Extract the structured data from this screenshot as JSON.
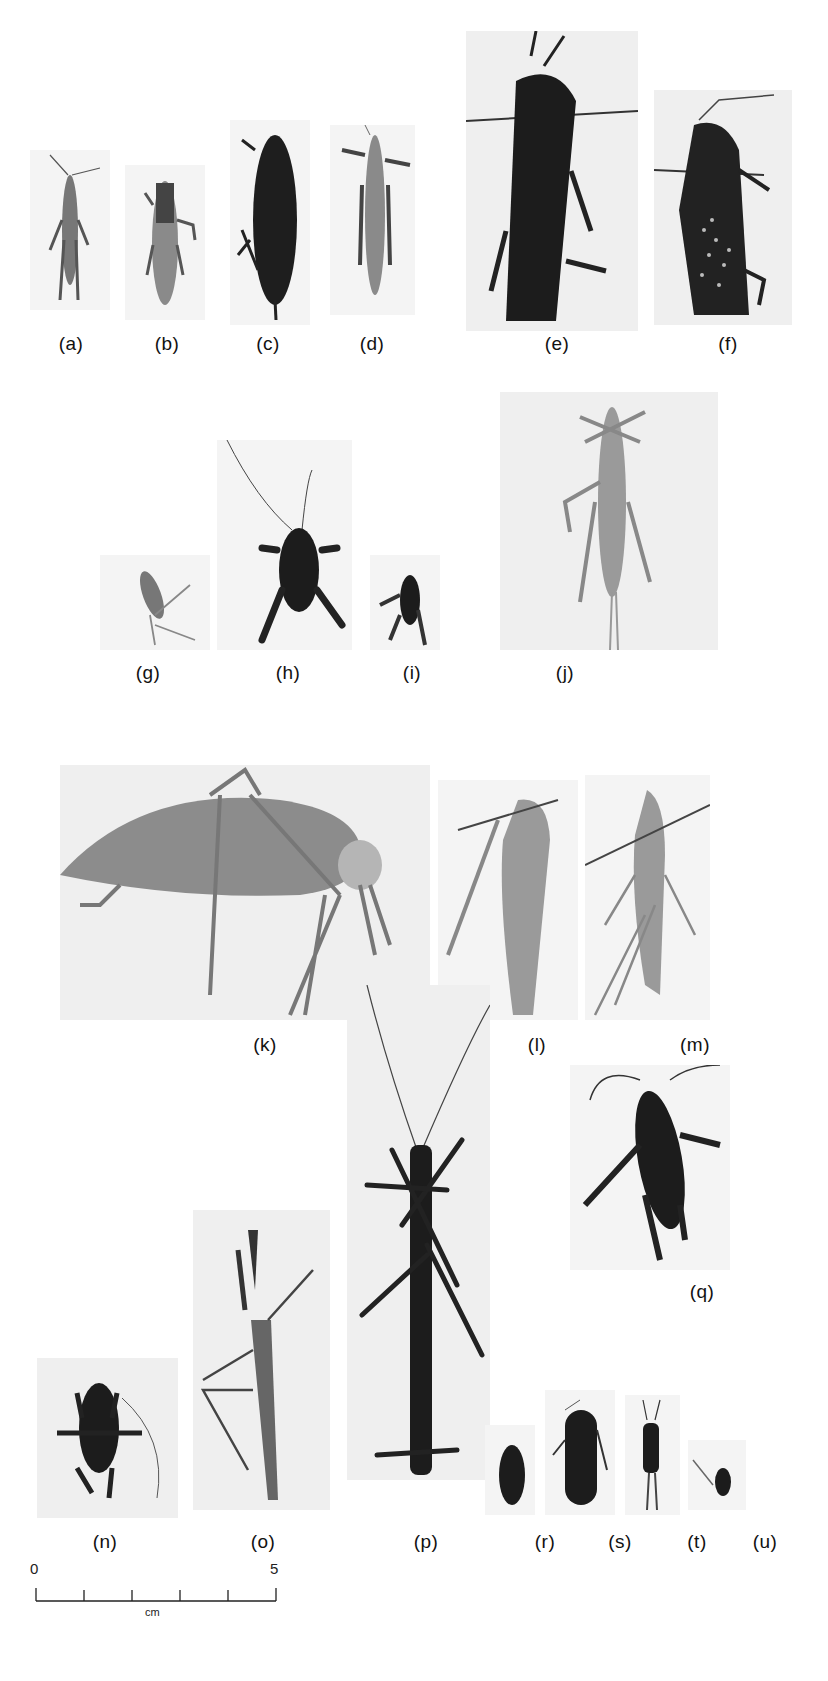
{
  "figure": {
    "background_color": "#ffffff",
    "ink_color": "#111111"
  },
  "specimens": [
    {
      "label": "(a)",
      "form": "slender grasshopper, dorsal view",
      "tone": "grey"
    },
    {
      "label": "(b)",
      "form": "grasshopper, dorsal view",
      "tone": "grey"
    },
    {
      "label": "(c)",
      "form": "dark grasshopper with ovipositor, dorsal view",
      "tone": "dark"
    },
    {
      "label": "(d)",
      "form": "slender grasshopper, dorsal view",
      "tone": "grey"
    },
    {
      "label": "(e)",
      "form": "large dark grasshopper, pinned",
      "tone": "dark"
    },
    {
      "label": "(f)",
      "form": "large spotted grasshopper, pinned",
      "tone": "dark"
    },
    {
      "label": "(g)",
      "form": "small pale insect",
      "tone": "light"
    },
    {
      "label": "(h)",
      "form": "dark cricket with long antennae",
      "tone": "dark"
    },
    {
      "label": "(i)",
      "form": "small dark cricket",
      "tone": "dark"
    },
    {
      "label": "(j)",
      "form": "long slender pale grasshopper",
      "tone": "light"
    },
    {
      "label": "(k)",
      "form": "katydid, lateral view",
      "tone": "grey"
    },
    {
      "label": "(l)",
      "form": "pale katydid, pinned",
      "tone": "light"
    },
    {
      "label": "(m)",
      "form": "pale long-legged katydid, pinned",
      "tone": "light"
    },
    {
      "label": "(n)",
      "form": "dark cricket, dorsal view",
      "tone": "dark"
    },
    {
      "label": "(o)",
      "form": "mantis, dorsal view",
      "tone": "grey"
    },
    {
      "label": "(p)",
      "form": "stick insect with long antennae, pinned",
      "tone": "dark"
    },
    {
      "label": "(q)",
      "form": "dark cricket, dorsal view",
      "tone": "dark"
    },
    {
      "label": "(r)",
      "form": "small cockroach",
      "tone": "dark"
    },
    {
      "label": "(s)",
      "form": "dark cockroach",
      "tone": "dark"
    },
    {
      "label": "(t)",
      "form": "small earwig-like insect",
      "tone": "dark"
    },
    {
      "label": "(u)",
      "form": "tiny pinned insect",
      "tone": "dark"
    }
  ],
  "scale_bar": {
    "start_label": "0",
    "end_label": "5",
    "unit": "cm",
    "ticks": 6
  }
}
